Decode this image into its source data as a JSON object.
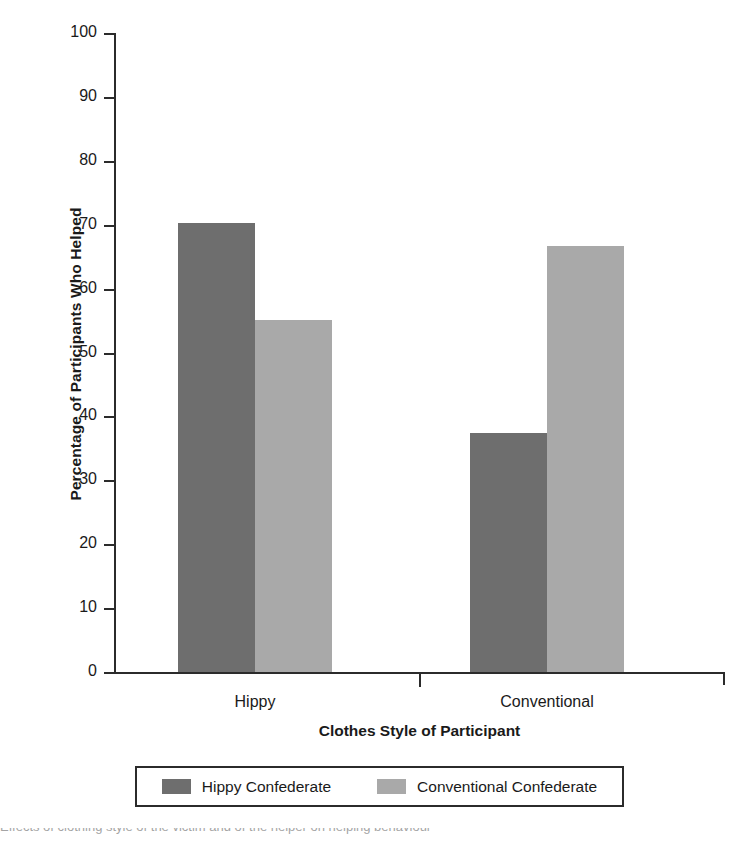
{
  "chart_data": {
    "type": "bar",
    "title": "",
    "xlabel": "Clothes Style of Participant",
    "ylabel": "Percentage of Participants Who Helped",
    "categories": [
      "Hippy",
      "Conventional"
    ],
    "series": [
      {
        "name": "Hippy Confederate",
        "color": "#6e6e6e",
        "values": [
          70.2,
          37.4
        ]
      },
      {
        "name": "Conventional Confederate",
        "color": "#a9a9a9",
        "values": [
          55.1,
          66.7
        ]
      }
    ],
    "ylim": [
      0,
      100
    ],
    "yticks": [
      0,
      10,
      20,
      30,
      40,
      50,
      60,
      70,
      80,
      90,
      100
    ],
    "ytick_labels": [
      "0",
      "10",
      "20",
      "30",
      "40",
      "50",
      "60",
      "70",
      "80",
      "90",
      "100"
    ],
    "grid": false,
    "legend_position": "bottom"
  },
  "axes": {
    "y_title": "Percentage of Participants Who Helped",
    "x_title": "Clothes Style of Participant",
    "y_labels": [
      "100",
      "90",
      "80",
      "70",
      "60",
      "50",
      "40",
      "30",
      "20",
      "10",
      "0"
    ],
    "x_labels": [
      "Hippy",
      "Conventional"
    ]
  },
  "legend": {
    "entries": [
      {
        "label": "Hippy Confederate",
        "color": "#6e6e6e"
      },
      {
        "label": "Conventional Confederate",
        "color": "#a9a9a9"
      }
    ]
  },
  "caption": {
    "remnant": "Effects of clothing style of the victim and of the helper on helping behaviour"
  }
}
